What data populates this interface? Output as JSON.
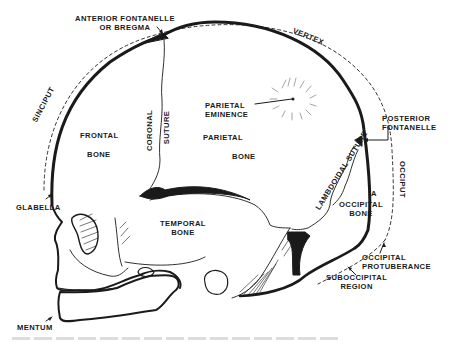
{
  "diagram": {
    "type": "anatomical-illustration",
    "colors": {
      "ink": "#1a1a1a",
      "background": "#ffffff"
    },
    "labels": {
      "anterior_fontanelle_line1": "ANTERIOR FONTANELLE",
      "anterior_fontanelle_line2": "OR BREGMA",
      "vertex": "VERTEX",
      "sinciput": "SINCIPUT",
      "parietal_eminence_line1": "PARIETAL",
      "parietal_eminence_line2": "EMINENCE",
      "posterior_fontanelle_line1": "POSTERIOR",
      "posterior_fontanelle_line2": "FONTANELLE",
      "frontal_bone_line1": "FRONTAL",
      "frontal_bone_line2": "BONE",
      "coronal_suture_line1": "CORONAL",
      "coronal_suture_line2": "SUTURE",
      "parietal_bone_line1": "PARIETAL",
      "parietal_bone_line2": "BONE",
      "lambdoidal_suture": "LAMBDOIDAL SUTURE",
      "occiput": "OCCIPUT",
      "point_a": "A",
      "occipital_bone_line1": "OCCIPITAL",
      "occipital_bone_line2": "BONE",
      "glabella": "GLABELLA",
      "temporal_bone_line1": "TEMPORAL",
      "temporal_bone_line2": "BONE",
      "occipital_protuberance_line1": "OCCIPITAL",
      "occipital_protuberance_line2": "PROTUBERANCE",
      "suboccipital_region_line1": "SUBOCCIPITAL",
      "suboccipital_region_line2": "REGION",
      "mentum": "MENTUM"
    }
  }
}
